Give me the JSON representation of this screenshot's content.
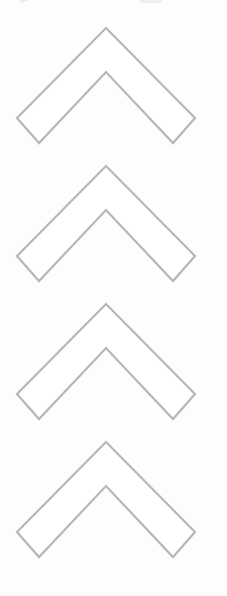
{
  "page": {
    "background_color": "#fdfdfd"
  },
  "chevron_stack": {
    "count": 4,
    "stroke_color": "#b7b7b7",
    "fill_color": "#ffffff",
    "stroke_width": "2.2",
    "items": [
      {
        "name": "chevron-up-1"
      },
      {
        "name": "chevron-up-2"
      },
      {
        "name": "chevron-up-3"
      },
      {
        "name": "chevron-up-4"
      }
    ]
  },
  "edge_artifacts": {
    "color": "#d9d9d9",
    "items": [
      {
        "name": "top-left-fragment"
      },
      {
        "name": "top-right-fragment"
      }
    ]
  }
}
